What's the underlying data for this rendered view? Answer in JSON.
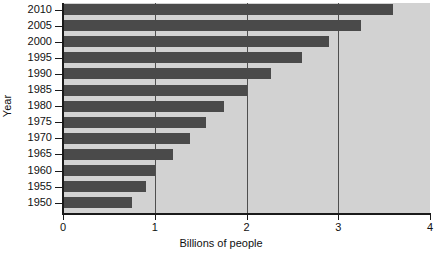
{
  "chart_data": {
    "type": "bar",
    "orientation": "horizontal",
    "title": "",
    "xlabel": "Billions of people",
    "ylabel": "Year",
    "categories": [
      "2010",
      "2005",
      "2000",
      "1995",
      "1990",
      "1985",
      "1980",
      "1975",
      "1970",
      "1965",
      "1960",
      "1955",
      "1950"
    ],
    "values": [
      3.6,
      3.25,
      2.9,
      2.6,
      2.27,
      2.0,
      1.75,
      1.56,
      1.38,
      1.2,
      1.0,
      0.9,
      0.75
    ],
    "xlim": [
      0,
      4
    ],
    "xticks": [
      0,
      1,
      2,
      3,
      4
    ],
    "xtick_labels": [
      "0",
      "1",
      "2",
      "3",
      "4"
    ],
    "grid": "vertical",
    "legend": "none",
    "colors": {
      "bar": "#4a4a4a",
      "plot_background": "#d2d2d2",
      "gridline": "#4f4f4f",
      "axis": "#1a1a1a",
      "text": "#111111",
      "figure_background": "#ffffff"
    }
  }
}
